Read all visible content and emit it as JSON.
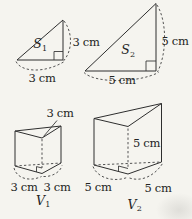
{
  "colors": {
    "background": "#f5f4ef",
    "line": "#2e2e2e",
    "dashed_line": "#4a4a4a",
    "text": "#242424"
  },
  "figures": {
    "s1": {
      "letter": "S",
      "sub": "1",
      "base_label": "3 cm",
      "height_label": "3 cm"
    },
    "s2": {
      "letter": "S",
      "sub": "2",
      "base_label": "5 cm",
      "height_label": "5 cm"
    },
    "v1": {
      "letter": "V",
      "sub": "1",
      "height_label": "3 cm",
      "base_left_label": "3 cm",
      "base_right_label": "3 cm"
    },
    "v2": {
      "letter": "V",
      "sub": "2",
      "height_label": "5 cm",
      "base_left_label": "5 cm",
      "base_right_label": "5 cm"
    }
  }
}
